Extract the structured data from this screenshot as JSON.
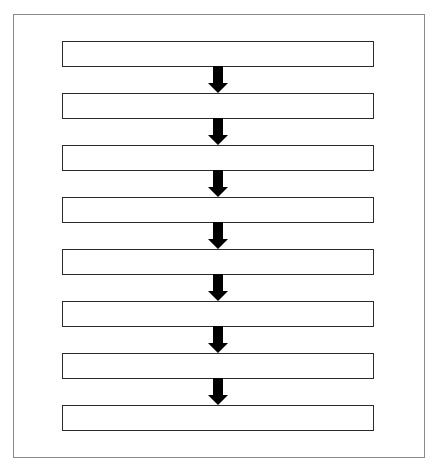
{
  "diagram": {
    "type": "vertical-flowchart",
    "frame_border_color": "#8a8a8a",
    "box_border_color": "#2a2a2a",
    "arrow_color": "#000000",
    "steps": [
      {
        "label": ""
      },
      {
        "label": ""
      },
      {
        "label": ""
      },
      {
        "label": ""
      },
      {
        "label": ""
      },
      {
        "label": ""
      },
      {
        "label": ""
      },
      {
        "label": ""
      }
    ],
    "arrows": [
      {
        "from": 1,
        "to": 2,
        "icon": "down-arrow-icon"
      },
      {
        "from": 2,
        "to": 3,
        "icon": "down-arrow-icon"
      },
      {
        "from": 3,
        "to": 4,
        "icon": "down-arrow-icon"
      },
      {
        "from": 4,
        "to": 5,
        "icon": "down-arrow-icon"
      },
      {
        "from": 5,
        "to": 6,
        "icon": "down-arrow-icon"
      },
      {
        "from": 6,
        "to": 7,
        "icon": "down-arrow-icon"
      },
      {
        "from": 7,
        "to": 8,
        "icon": "down-arrow-icon"
      }
    ]
  }
}
